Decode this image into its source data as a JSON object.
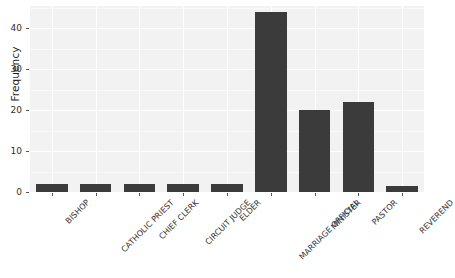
{
  "chart_data": {
    "type": "bar",
    "title": "",
    "xlabel": "",
    "ylabel": "Frequency",
    "categories": [
      "BISHOP",
      "CATHOLIC PRIEST",
      "CHIEF CLERK",
      "CIRCUIT JUDGE",
      "ELDER",
      "MARRIAGE OFFICIAL",
      "MINISTER",
      "PASTOR",
      "REVEREND"
    ],
    "values": [
      2,
      2,
      2,
      2,
      2,
      44,
      20,
      22,
      1.5
    ],
    "ylim": [
      0,
      45.5
    ],
    "yticks": [
      0,
      10,
      20,
      30,
      40
    ],
    "ytick_labels": [
      "0",
      "10",
      "20",
      "30",
      "40"
    ],
    "grid": true,
    "legend": "none",
    "bar_color": "#3b3b3b",
    "panel_color": "#f2f2f2",
    "gridline_color": "#ffffff"
  },
  "axes": {
    "y_title": "Frequency"
  }
}
